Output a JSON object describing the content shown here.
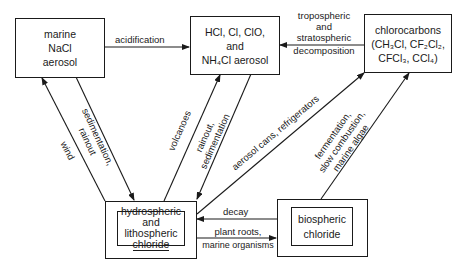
{
  "nodes": {
    "marine": {
      "lines": [
        "marine",
        "NaCl",
        "aerosol"
      ]
    },
    "hcl": {
      "lines": [
        "HCl, Cl, ClO,",
        "and",
        "NH₄Cl aerosol"
      ]
    },
    "chlorocarbons": {
      "lines": [
        "chlorocarbons",
        "(CH₃Cl, CF₂Cl₂,",
        "CFCl₃, CCl₄)"
      ]
    },
    "hydrospheric": {
      "lines": [
        "hydrospheric",
        "and",
        "lithospheric",
        "chloride"
      ]
    },
    "biospheric": {
      "lines": [
        "biospheric",
        "chloride"
      ]
    }
  },
  "edges": {
    "acidification": {
      "label": "acidification"
    },
    "decomposition": {
      "lines": [
        "tropospheric",
        "and",
        "stratospheric",
        "decomposition"
      ]
    },
    "wind": {
      "label": "wind"
    },
    "sedimentation_rainout": {
      "lines": [
        "sedimentation,",
        "rainout"
      ]
    },
    "volcanoes": {
      "label": "volcanoes"
    },
    "rainout_sedimentation": {
      "lines": [
        "rainout,",
        "sedimentation"
      ]
    },
    "aerosol_cans": {
      "label": "aerosol cans, refrigerators"
    },
    "fermentation": {
      "lines": [
        "fermentation,",
        "slow combustion,",
        "marine algae"
      ]
    },
    "decay": {
      "label": "decay"
    },
    "plant_roots": {
      "lines": [
        "plant roots,",
        "marine organisms"
      ]
    }
  }
}
